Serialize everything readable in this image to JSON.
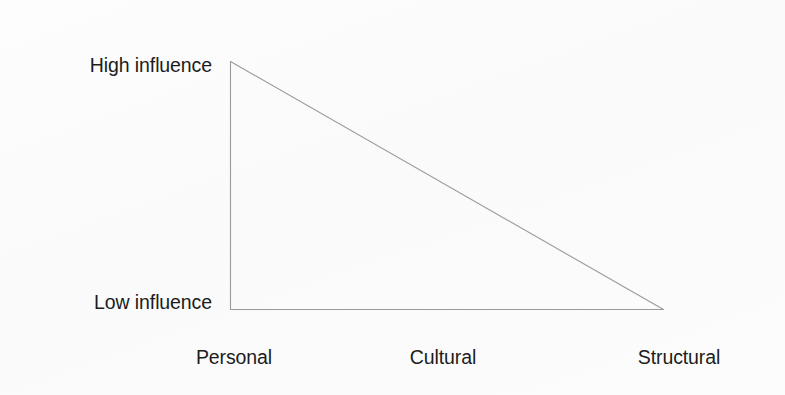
{
  "figure": {
    "kind": "triangle-influence-diagram",
    "background_color": "#fcfcfc",
    "line_color": "#9a9a9a",
    "text_color": "#1c1c1c"
  },
  "y_axis": {
    "top_label": "High influence",
    "bottom_label": "Low influence"
  },
  "x_axis": {
    "labels": [
      {
        "text": "Personal"
      },
      {
        "text": "Cultural"
      },
      {
        "text": "Structural"
      }
    ]
  },
  "chart_data": {
    "type": "area",
    "title": "",
    "xlabel": "",
    "ylabel": "",
    "categories": [
      "Personal",
      "Cultural",
      "Structural"
    ],
    "values": [
      1,
      0.5,
      0
    ],
    "x": [
      230,
      447,
      664
    ],
    "ylim": [
      0,
      1
    ],
    "xlim": [
      230,
      664
    ],
    "ytick_labels": [
      "Low influence",
      "High influence"
    ],
    "ytick_values": [
      0,
      1
    ],
    "grid": false,
    "legend": null,
    "annotations": [],
    "shape": {
      "name": "right-triangle",
      "vertices": [
        {
          "name": "apex-high-personal",
          "x": 230,
          "y": 61
        },
        {
          "name": "origin-low-personal",
          "x": 230,
          "y": 310
        },
        {
          "name": "low-structural",
          "x": 664,
          "y": 310
        }
      ],
      "fill": "none",
      "stroke": "#9a9a9a",
      "stroke_width": 1
    }
  }
}
